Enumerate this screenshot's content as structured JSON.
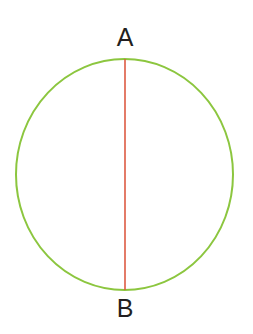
{
  "figure": {
    "background_color": "#ffffff",
    "width": 253,
    "height": 334
  },
  "labels": {
    "top": "A",
    "bottom": "B",
    "color": "#231f20",
    "font_size_px": 25
  },
  "shapes": {
    "circle": {
      "name": "circle-outline",
      "stroke_color": "#8cc63f",
      "stroke_width": 2,
      "fill": "none",
      "center_x": 124.5,
      "center_y": 174.5,
      "radius_x": 108.5,
      "radius_y": 115.5
    },
    "diameter": {
      "name": "diameter-segment-ab",
      "stroke_color": "#dd5b43",
      "stroke_width": 1.6,
      "x1": 125,
      "y1": 59,
      "x2": 125,
      "y2": 290
    }
  },
  "chart_data": {
    "type": "diagram",
    "elements": [
      {
        "kind": "circle",
        "label": "circle",
        "center": [
          124.5,
          174.5
        ],
        "radius_x": 108.5,
        "radius_y": 115.5,
        "stroke": "#8cc63f"
      },
      {
        "kind": "segment",
        "label": "AB",
        "from_point": "A",
        "to_point": "B",
        "from": [
          125,
          59
        ],
        "to": [
          125,
          290
        ],
        "stroke": "#dd5b43"
      },
      {
        "kind": "point-label",
        "label": "A",
        "position": [
          125,
          38
        ],
        "anchor": "top-of-circle"
      },
      {
        "kind": "point-label",
        "label": "B",
        "position": [
          125,
          309
        ],
        "anchor": "bottom-of-circle"
      }
    ]
  }
}
